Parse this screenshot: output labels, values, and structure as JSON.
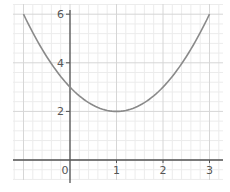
{
  "chart_data": {
    "type": "line",
    "title": "",
    "xlabel": "",
    "ylabel": "",
    "function": "y = (x - 1)^2 + 2",
    "x": [
      -1,
      -0.5,
      0,
      0.5,
      1,
      1.5,
      2,
      2.5,
      3
    ],
    "series": [
      {
        "name": "curve",
        "values": [
          6,
          4.25,
          3,
          2.25,
          2,
          2.25,
          3,
          4.25,
          6
        ]
      }
    ],
    "xlim": [
      -1.2,
      3.3
    ],
    "ylim": [
      -0.8,
      6.4
    ],
    "x_ticks": [
      "0",
      "1",
      "2",
      "3"
    ],
    "y_ticks": [
      "2",
      "4",
      "6"
    ],
    "grid": true,
    "legend": null
  },
  "colors": {
    "minor_grid": "#ececec",
    "major_grid": "#d6d6d6",
    "axis": "#555555",
    "curve": "#8a8a8a"
  }
}
